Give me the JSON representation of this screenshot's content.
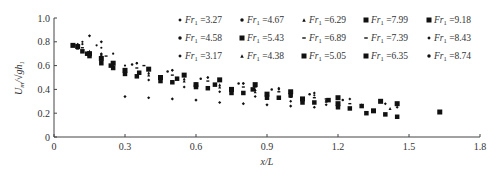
{
  "chart_data": {
    "type": "scatter",
    "title": "",
    "xlabel": "x/L",
    "ylabel": "U_m/√(gh₁)",
    "xlim": [
      0,
      1.8
    ],
    "ylim": [
      0,
      1.0
    ],
    "xticks": [
      "0",
      "0.3",
      "0.6",
      "0.9",
      "1.2",
      "1.5",
      "1.8"
    ],
    "yticks": [
      "0",
      "0.2",
      "0.4",
      "0.6",
      "0.8",
      "1.0"
    ],
    "grid": false,
    "legend_position": "top-right, 3 rows x 5 columns",
    "series": [
      {
        "name": "Fr1=3.27",
        "marker": "diamond",
        "size": 3.2,
        "points": [
          [
            0.15,
            0.85
          ],
          [
            0.2,
            0.8
          ],
          [
            0.3,
            0.34
          ],
          [
            0.4,
            0.33
          ],
          [
            0.5,
            0.32
          ],
          [
            0.6,
            0.31
          ],
          [
            0.7,
            0.29
          ],
          [
            0.8,
            0.28
          ],
          [
            0.9,
            0.27
          ],
          [
            1.0,
            0.26
          ],
          [
            1.1,
            0.25
          ]
        ]
      },
      {
        "name": "Fr1=4.67",
        "marker": "dot",
        "size": 2.2,
        "points": [
          [
            0.12,
            0.78
          ],
          [
            0.2,
            0.75
          ],
          [
            0.3,
            0.6
          ],
          [
            0.45,
            0.5
          ],
          [
            0.6,
            0.45
          ],
          [
            0.75,
            0.4
          ],
          [
            0.9,
            0.36
          ],
          [
            1.05,
            0.32
          ],
          [
            1.2,
            0.28
          ]
        ]
      },
      {
        "name": "Fr1=6.29",
        "marker": "triangle",
        "size": 3,
        "points": [
          [
            0.15,
            0.7
          ],
          [
            0.25,
            0.6
          ],
          [
            0.4,
            0.52
          ],
          [
            0.55,
            0.47
          ],
          [
            0.7,
            0.42
          ],
          [
            0.85,
            0.38
          ],
          [
            1.0,
            0.34
          ],
          [
            1.15,
            0.3
          ],
          [
            1.3,
            0.27
          ],
          [
            1.42,
            0.24
          ]
        ]
      },
      {
        "name": "Fr1=7.99",
        "marker": "square",
        "size": 5,
        "points": [
          [
            0.1,
            0.76
          ],
          [
            0.2,
            0.66
          ],
          [
            0.3,
            0.56
          ],
          [
            0.45,
            0.5
          ],
          [
            0.6,
            0.44
          ],
          [
            0.75,
            0.4
          ],
          [
            0.9,
            0.36
          ],
          [
            1.05,
            0.32
          ],
          [
            1.2,
            0.28
          ],
          [
            1.35,
            0.22
          ]
        ]
      },
      {
        "name": "Fr1=9.18",
        "marker": "square",
        "size": 5,
        "points": [
          [
            0.08,
            0.77
          ],
          [
            0.15,
            0.7
          ],
          [
            0.25,
            0.62
          ],
          [
            0.4,
            0.57
          ],
          [
            0.55,
            0.52
          ],
          [
            0.7,
            0.48
          ],
          [
            0.85,
            0.44
          ],
          [
            1.0,
            0.38
          ],
          [
            1.2,
            0.33
          ],
          [
            1.38,
            0.3
          ],
          [
            1.45,
            0.28
          ],
          [
            1.63,
            0.21
          ]
        ]
      },
      {
        "name": "Fr1=4.58",
        "marker": "dot",
        "size": 2.2,
        "points": [
          [
            0.12,
            0.8
          ],
          [
            0.18,
            0.77
          ],
          [
            0.25,
            0.7
          ],
          [
            0.35,
            0.62
          ],
          [
            0.5,
            0.56
          ],
          [
            0.65,
            0.5
          ],
          [
            0.8,
            0.45
          ],
          [
            0.95,
            0.4
          ],
          [
            1.1,
            0.35
          ]
        ]
      },
      {
        "name": "Fr1=5.43",
        "marker": "square",
        "size": 4.5,
        "points": [
          [
            0.12,
            0.72
          ],
          [
            0.2,
            0.62
          ],
          [
            0.3,
            0.53
          ],
          [
            0.45,
            0.47
          ],
          [
            0.6,
            0.42
          ],
          [
            0.75,
            0.37
          ],
          [
            0.9,
            0.33
          ],
          [
            1.05,
            0.29
          ],
          [
            1.2,
            0.25
          ],
          [
            1.32,
            0.2
          ]
        ]
      },
      {
        "name": "Fr1=6.89",
        "marker": "dash",
        "size": 3,
        "points": [
          [
            0.1,
            0.74
          ],
          [
            0.2,
            0.66
          ],
          [
            0.35,
            0.58
          ],
          [
            0.5,
            0.52
          ],
          [
            0.65,
            0.47
          ],
          [
            0.8,
            0.42
          ],
          [
            0.95,
            0.38
          ],
          [
            1.1,
            0.33
          ],
          [
            1.25,
            0.28
          ]
        ]
      },
      {
        "name": "Fr1=7.39",
        "marker": "dash",
        "size": 3,
        "points": [
          [
            0.12,
            0.75
          ],
          [
            0.22,
            0.68
          ],
          [
            0.38,
            0.6
          ],
          [
            0.55,
            0.53
          ],
          [
            0.7,
            0.47
          ],
          [
            0.85,
            0.42
          ],
          [
            1.0,
            0.37
          ],
          [
            1.15,
            0.32
          ],
          [
            1.3,
            0.27
          ]
        ]
      },
      {
        "name": "Fr1=8.43",
        "marker": "diamond",
        "size": 3,
        "points": [
          [
            0.1,
            0.78
          ],
          [
            0.2,
            0.7
          ],
          [
            0.35,
            0.62
          ],
          [
            0.5,
            0.56
          ],
          [
            0.65,
            0.5
          ],
          [
            0.8,
            0.45
          ],
          [
            0.95,
            0.41
          ],
          [
            1.1,
            0.37
          ],
          [
            1.25,
            0.32
          ],
          [
            1.4,
            0.28
          ],
          [
            1.45,
            0.25
          ]
        ]
      },
      {
        "name": "Fr1=3.17",
        "marker": "diamond",
        "size": 3,
        "points": [
          [
            0.2,
            0.66
          ],
          [
            0.3,
            0.55
          ],
          [
            0.4,
            0.48
          ],
          [
            0.55,
            0.42
          ],
          [
            0.7,
            0.38
          ],
          [
            0.85,
            0.34
          ],
          [
            1.0,
            0.3
          ],
          [
            1.15,
            0.27
          ]
        ]
      },
      {
        "name": "Fr1=4.38",
        "marker": "triangle",
        "size": 3,
        "points": [
          [
            0.15,
            0.72
          ],
          [
            0.25,
            0.62
          ],
          [
            0.4,
            0.54
          ],
          [
            0.55,
            0.49
          ],
          [
            0.7,
            0.44
          ],
          [
            0.85,
            0.4
          ],
          [
            1.0,
            0.36
          ],
          [
            1.15,
            0.31
          ],
          [
            1.3,
            0.26
          ]
        ]
      },
      {
        "name": "Fr1=5.05",
        "marker": "square",
        "size": 4.5,
        "points": [
          [
            0.15,
            0.68
          ],
          [
            0.25,
            0.58
          ],
          [
            0.35,
            0.51
          ],
          [
            0.5,
            0.46
          ],
          [
            0.65,
            0.41
          ],
          [
            0.8,
            0.37
          ],
          [
            0.95,
            0.33
          ],
          [
            1.1,
            0.29
          ],
          [
            1.25,
            0.24
          ],
          [
            1.4,
            0.19
          ]
        ]
      },
      {
        "name": "Fr1=6.35",
        "marker": "square",
        "size": 4.5,
        "points": [
          [
            0.14,
            0.7
          ],
          [
            0.24,
            0.6
          ],
          [
            0.36,
            0.54
          ],
          [
            0.52,
            0.49
          ],
          [
            0.68,
            0.44
          ],
          [
            0.84,
            0.4
          ],
          [
            1.0,
            0.35
          ],
          [
            1.16,
            0.31
          ],
          [
            1.3,
            0.26
          ],
          [
            1.45,
            0.17
          ]
        ]
      },
      {
        "name": "Fr1=8.74",
        "marker": "dot",
        "size": 2.5,
        "points": [
          [
            0.1,
            0.76
          ],
          [
            0.2,
            0.69
          ],
          [
            0.33,
            0.61
          ],
          [
            0.48,
            0.55
          ],
          [
            0.62,
            0.49
          ],
          [
            0.78,
            0.45
          ],
          [
            0.92,
            0.4
          ],
          [
            1.08,
            0.36
          ],
          [
            1.22,
            0.31
          ],
          [
            1.45,
            0.27
          ]
        ]
      }
    ]
  },
  "legend": {
    "rows": [
      [
        {
          "marker": "diamond",
          "prefix": "Fr",
          "sub": "1",
          "value": "=3.27"
        },
        {
          "marker": "dot",
          "prefix": "Fr",
          "sub": "1",
          "value": "=4.67"
        },
        {
          "marker": "triangle",
          "prefix": "Fr",
          "sub": "1",
          "value": "=6.29"
        },
        {
          "marker": "square",
          "prefix": "Fr",
          "sub": "1",
          "value": "=7.99"
        },
        {
          "marker": "square",
          "prefix": "Fr",
          "sub": "1",
          "value": "=9.18"
        }
      ],
      [
        {
          "marker": "dot",
          "prefix": "Fr",
          "sub": "1",
          "value": "=4.58"
        },
        {
          "marker": "square",
          "prefix": "Fr",
          "sub": "1",
          "value": "=5.43"
        },
        {
          "marker": "dash",
          "prefix": "Fr",
          "sub": "1",
          "value": "=6.89"
        },
        {
          "marker": "dash",
          "prefix": "Fr",
          "sub": "1",
          "value": "=7.39"
        },
        {
          "marker": "diamond",
          "prefix": "Fr",
          "sub": "1",
          "value": "=8.43"
        }
      ],
      [
        {
          "marker": "diamond",
          "prefix": "Fr",
          "sub": "1",
          "value": "=3.17"
        },
        {
          "marker": "triangle",
          "prefix": "Fr",
          "sub": "1",
          "value": "=4.38"
        },
        {
          "marker": "square",
          "prefix": "Fr",
          "sub": "1",
          "value": "=5.05"
        },
        {
          "marker": "square",
          "prefix": "Fr",
          "sub": "1",
          "value": "=6.35"
        },
        {
          "marker": "dot",
          "prefix": "Fr",
          "sub": "1",
          "value": "=8.74"
        }
      ]
    ]
  },
  "axes": {
    "x_title": "x/L",
    "y_title_main": "U",
    "y_title_sub": "m",
    "y_title_rest": "/√gh",
    "y_title_sub2": "1"
  },
  "colors": {
    "marker": "#111111",
    "axis": "#444444",
    "text": "#333333"
  }
}
